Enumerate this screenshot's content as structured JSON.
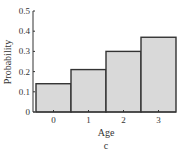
{
  "chart_data": {
    "type": "bar",
    "title": "",
    "panel_label": "c",
    "xlabel": "Age",
    "ylabel": "Probability",
    "categories": [
      "0",
      "1",
      "2",
      "3"
    ],
    "values": [
      0.14,
      0.21,
      0.3,
      0.37
    ],
    "ylim": [
      0,
      0.5
    ],
    "yticks": [
      "0",
      "0.1",
      "0.2",
      "0.3",
      "0.4",
      "0.5"
    ],
    "grid": false,
    "legend": null,
    "bar_fill": "#d9d9d9",
    "bar_stroke": "#333333"
  }
}
